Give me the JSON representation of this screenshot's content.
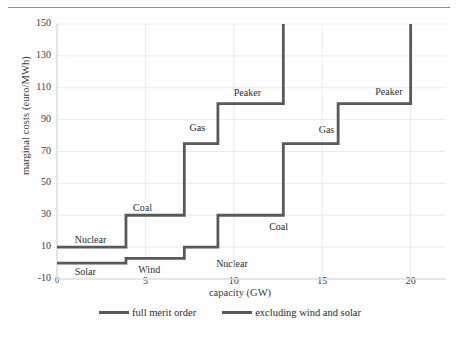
{
  "chart_data": {
    "type": "line",
    "title": "",
    "xlabel": "capacity (GW)",
    "ylabel": "marginal costs (euro/MWh)",
    "xlim": [
      0,
      22
    ],
    "ylim": [
      -10,
      150
    ],
    "xticks": [
      0,
      5,
      10,
      15,
      20
    ],
    "xtick_labels": [
      "0",
      "5",
      "10",
      "15",
      "20"
    ],
    "yticks": [
      -10,
      10,
      30,
      50,
      70,
      90,
      110,
      130,
      150
    ],
    "ytick_labels": [
      "-10",
      "10",
      "30",
      "50",
      "70",
      "90",
      "110",
      "130",
      "150"
    ],
    "grid": true,
    "legend_position": "bottom",
    "series": [
      {
        "name": "full merit order",
        "color": "#595959",
        "steps": [
          {
            "label": "Solar",
            "x_start": 0.0,
            "x_end": 3.9,
            "y": 0
          },
          {
            "label": "Wind",
            "x_start": 3.9,
            "x_end": 7.2,
            "y": 3
          },
          {
            "label": "Nuclear",
            "x_start": 7.2,
            "x_end": 9.1,
            "y": 10
          },
          {
            "label": "Coal",
            "x_start": 9.1,
            "x_end": 12.8,
            "y": 30
          },
          {
            "label": "Gas",
            "x_start": 12.8,
            "x_end": 15.9,
            "y": 75
          },
          {
            "label": "Peaker",
            "x_start": 15.9,
            "x_end": 20.0,
            "y": 100
          }
        ],
        "final_rise_to": 150
      },
      {
        "name": "excluding wind and solar",
        "color": "#595959",
        "steps": [
          {
            "label": "Nuclear",
            "x_start": 0.0,
            "x_end": 3.9,
            "y": 10
          },
          {
            "label": "Coal",
            "x_start": 3.9,
            "x_end": 7.2,
            "y": 30
          },
          {
            "label": "Gas",
            "x_start": 7.2,
            "x_end": 9.1,
            "y": 75
          },
          {
            "label": "Peaker",
            "x_start": 9.1,
            "x_end": 12.8,
            "y": 100
          }
        ],
        "final_rise_to": 150
      }
    ],
    "point_labels": [
      {
        "text": "Solar",
        "x": 1.0,
        "y": -6
      },
      {
        "text": "Wind",
        "x": 4.6,
        "y": -5
      },
      {
        "text": "Nuclear",
        "x": 9.0,
        "y": -1
      },
      {
        "text": "Coal",
        "x": 12.0,
        "y": 22
      },
      {
        "text": "Gas",
        "x": 14.8,
        "y": 83
      },
      {
        "text": "Peaker",
        "x": 18.0,
        "y": 107
      },
      {
        "text": "Nuclear",
        "x": 1.0,
        "y": 14
      },
      {
        "text": "Coal",
        "x": 4.3,
        "y": 34
      },
      {
        "text": "Gas",
        "x": 7.5,
        "y": 84
      },
      {
        "text": "Peaker",
        "x": 10.0,
        "y": 106
      }
    ]
  },
  "legend": {
    "entries": [
      {
        "label": "full merit order"
      },
      {
        "label": "excluding wind and solar"
      }
    ]
  }
}
